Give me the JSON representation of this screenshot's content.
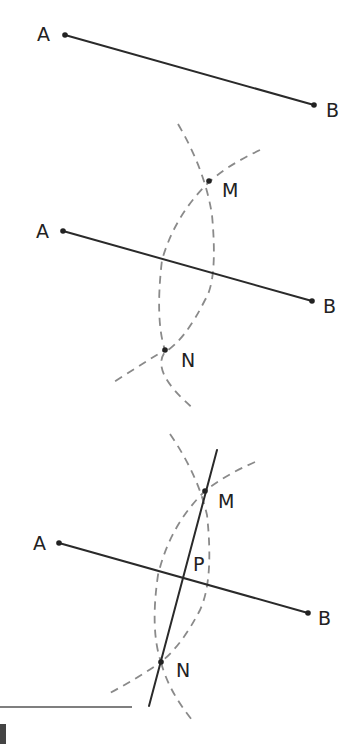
{
  "diagram": {
    "colors": {
      "line": "#2a2a2a",
      "arc": "#8a8a8a",
      "label": "#222222"
    },
    "panels": [
      {
        "id": "step1",
        "points": {
          "A": [
            65,
            35
          ],
          "B": [
            314,
            105
          ]
        },
        "labels": {
          "A": "A",
          "B": "B"
        }
      },
      {
        "id": "step2",
        "points": {
          "A": [
            63,
            231
          ],
          "B": [
            312,
            301
          ],
          "M": [
            209,
            181
          ],
          "N": [
            165,
            350
          ]
        },
        "labels": {
          "A": "A",
          "B": "B",
          "M": "M",
          "N": "N"
        }
      },
      {
        "id": "step3",
        "points": {
          "A": [
            59,
            543
          ],
          "B": [
            308,
            613
          ],
          "M": [
            205,
            491
          ],
          "N": [
            161,
            662
          ],
          "P": [
            183,
            578
          ]
        },
        "labels": {
          "A": "A",
          "B": "B",
          "M": "M",
          "N": "N",
          "P": "P"
        }
      }
    ]
  }
}
